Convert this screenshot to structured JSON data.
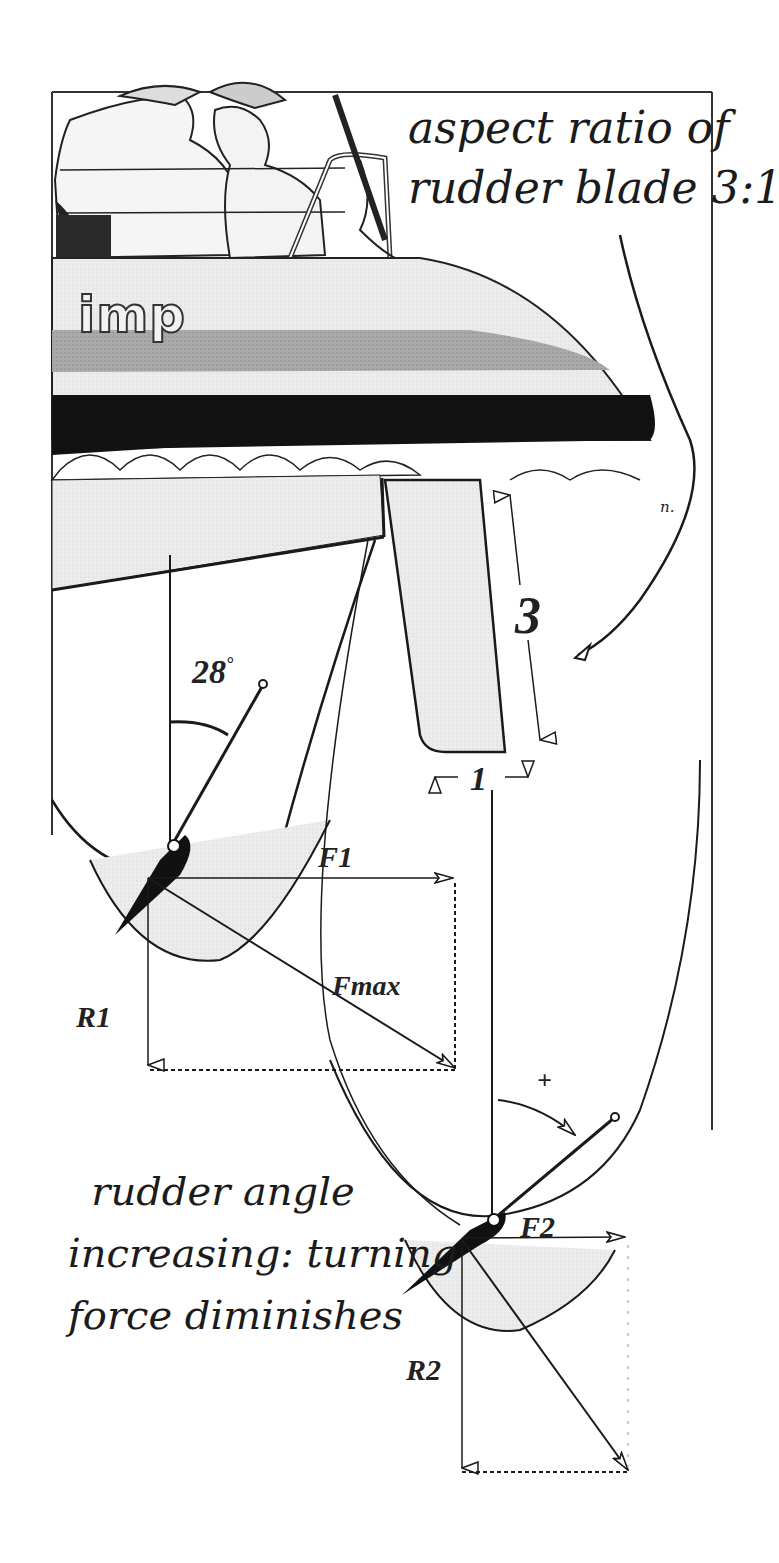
{
  "figure": {
    "caption_top": {
      "line1": "aspect ratio of",
      "line2": "rudder blade 3:1"
    },
    "caption_bottom": {
      "line1": "rudder angle",
      "line2": "increasing: turning",
      "line3": "force diminishes"
    },
    "boat_name": "imp",
    "artist_signature": "n.",
    "rudder_dimensions": {
      "height_label": "3",
      "chord_label": "1"
    },
    "state_1": {
      "rudder_angle": "28",
      "angle_unit": "°",
      "turning_force_label": "F1",
      "total_force_label": "Fmax",
      "drag_force_label": "R1"
    },
    "state_2": {
      "increase_marker": "+",
      "turning_force_label": "F2",
      "drag_force_label": "R2"
    },
    "colors": {
      "ink": "#1a1a1a",
      "hull_gray": "#a8a8a8",
      "hull_light": "#e9e9e9",
      "boot_stripe": "#111111",
      "paper": "#ffffff"
    }
  }
}
